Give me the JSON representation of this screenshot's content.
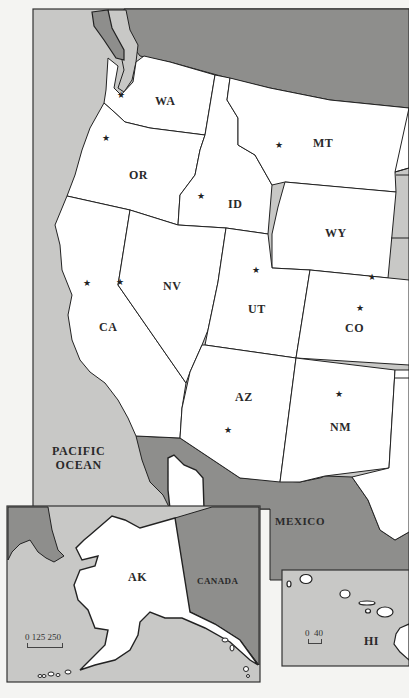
{
  "colors": {
    "ocean": "#c8c8c6",
    "foreign_land": "#8e8e8c",
    "us_land": "#ffffff",
    "border": "#222222",
    "page": "#f4f4f2"
  },
  "water_labels": {
    "pacific_line1": "PACIFIC",
    "pacific_line2": "OCEAN"
  },
  "country_labels": {
    "mexico": "MEXICO",
    "canada": "CANADA"
  },
  "states": [
    {
      "abbr": "WA",
      "x": 155,
      "y": 103
    },
    {
      "abbr": "OR",
      "x": 139,
      "y": 177
    },
    {
      "abbr": "ID",
      "x": 235,
      "y": 206
    },
    {
      "abbr": "MT",
      "x": 323,
      "y": 145
    },
    {
      "abbr": "WY",
      "x": 335,
      "y": 235
    },
    {
      "abbr": "NV",
      "x": 172,
      "y": 287
    },
    {
      "abbr": "CA",
      "x": 108,
      "y": 328
    },
    {
      "abbr": "UT",
      "x": 257,
      "y": 310
    },
    {
      "abbr": "CO",
      "x": 355,
      "y": 329
    },
    {
      "abbr": "AZ",
      "x": 244,
      "y": 398
    },
    {
      "abbr": "NM",
      "x": 342,
      "y": 428
    },
    {
      "abbr": "AK",
      "x": 137,
      "y": 578
    },
    {
      "abbr": "HI",
      "x": 372,
      "y": 642
    }
  ],
  "capitals": [
    {
      "state": "WA",
      "x": 121,
      "y": 95
    },
    {
      "state": "OR",
      "x": 106,
      "y": 138
    },
    {
      "state": "ID",
      "x": 201,
      "y": 196
    },
    {
      "state": "MT",
      "x": 279,
      "y": 145
    },
    {
      "state": "WY",
      "x": 372,
      "y": 277
    },
    {
      "state": "CA",
      "x": 87,
      "y": 283
    },
    {
      "state": "NV",
      "x": 120,
      "y": 282
    },
    {
      "state": "UT",
      "x": 256,
      "y": 270
    },
    {
      "state": "CO",
      "x": 360,
      "y": 308
    },
    {
      "state": "AZ",
      "x": 228,
      "y": 430
    },
    {
      "state": "NM",
      "x": 339,
      "y": 394
    }
  ],
  "capital_symbol": "★",
  "scales": {
    "alaska": "0 125 250",
    "hawaii": "0  40"
  }
}
